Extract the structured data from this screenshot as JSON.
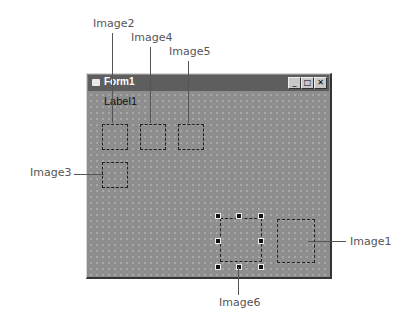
{
  "window": {
    "title": "Form1",
    "buttons": {
      "minimize": "_",
      "maximize": "□",
      "close": "✕"
    },
    "label": "Label1"
  },
  "callouts": {
    "image1": "Image1",
    "image2": "Image2",
    "image3": "Image3",
    "image4": "Image4",
    "image5": "Image5",
    "image6": "Image6"
  },
  "selected_control": "Image6"
}
